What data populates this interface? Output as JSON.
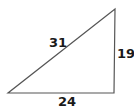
{
  "diagram": {
    "type": "right-triangle",
    "vertices": {
      "bottom_left": [
        8,
        93
      ],
      "bottom_right": [
        114,
        93
      ],
      "top_right": [
        115,
        9
      ]
    },
    "stroke_color": "#555555",
    "labels": {
      "hypotenuse": "31",
      "vertical_side": "19",
      "base": "24"
    }
  }
}
